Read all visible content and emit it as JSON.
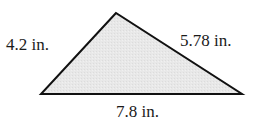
{
  "diagram": {
    "type": "triangle",
    "fill_color": "#e6e6e6",
    "stroke_color": "#111111",
    "vertices": {
      "top": [
        116,
        13
      ],
      "bottom_left": [
        41,
        94
      ],
      "bottom_right": [
        242,
        94
      ]
    },
    "sides": {
      "left": {
        "label": "4.2 in.",
        "length": 4.2,
        "unit": "in."
      },
      "right": {
        "label": "5.78 in.",
        "length": 5.78,
        "unit": "in."
      },
      "bottom": {
        "label": "7.8 in.",
        "length": 7.8,
        "unit": "in."
      }
    }
  }
}
